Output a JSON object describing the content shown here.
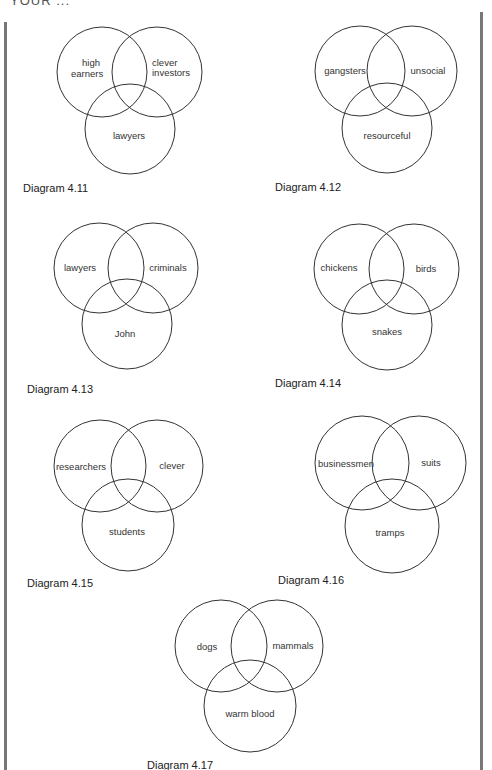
{
  "header": {
    "partial_text": "YOUR ..."
  },
  "diagrams": [
    {
      "caption": "Diagram 4.11",
      "sets": [
        "high earners",
        "clever investors",
        "lawyers"
      ],
      "marks": [
        "intersection clever investors ∩ lawyers (outside high earners)",
        "lawyers only"
      ]
    },
    {
      "caption": "Diagram 4.12",
      "sets": [
        "gangsters",
        "unsocial",
        "resourceful"
      ],
      "marks": [
        "gangsters only",
        "gangsters ∩ unsocial (outside resourceful)",
        "gangsters ∩ resourceful (outside unsocial)"
      ]
    },
    {
      "caption": "Diagram 4.13",
      "sets": [
        "lawyers",
        "criminals",
        "John"
      ],
      "marks": [
        "lawyers ∩ criminals (outside John)",
        "lawyers ∩ criminals ∩ John",
        "lawyers ∩ John (outside criminals)"
      ]
    },
    {
      "caption": "Diagram 4.14",
      "sets": [
        "chickens",
        "birds",
        "snakes"
      ],
      "marks": [
        "chickens only",
        "chickens ∩ snakes (outside birds)",
        "chickens ∩ birds ∩ snakes"
      ]
    },
    {
      "caption": "Diagram 4.15",
      "sets": [
        "researchers",
        "clever",
        "students"
      ],
      "marks": [
        "researchers only"
      ]
    },
    {
      "caption": "Diagram 4.16",
      "sets": [
        "businessmen",
        "suits",
        "tramps"
      ],
      "marks": [
        "businessmen only",
        "businessmen ∩ tramps (outside suits)",
        "businessmen ∩ suits ∩ tramps"
      ]
    },
    {
      "caption": "Diagram 4.17",
      "sets": [
        "dogs",
        "mammals",
        "warm blood"
      ],
      "marks": [
        "dogs only",
        "dogs ∩ mammals (outside warm blood)",
        "mammals only",
        "dogs ∩ warm blood (outside mammals)"
      ]
    }
  ],
  "labels": {
    "d411": {
      "a1": "high",
      "a2": "earners",
      "b1": "clever",
      "b2": "investors",
      "c": "lawyers"
    },
    "d412": {
      "a": "gangsters",
      "b": "unsocial",
      "c": "resourceful"
    },
    "d413": {
      "a": "lawyers",
      "b": "criminals",
      "c": "John"
    },
    "d414": {
      "a": "chickens",
      "b": "birds",
      "c": "snakes"
    },
    "d415": {
      "a": "researchers",
      "b": "clever",
      "c": "students"
    },
    "d416": {
      "a": "businessmen",
      "b": "suits",
      "c": "tramps"
    },
    "d417": {
      "a": "dogs",
      "b": "mammals",
      "c": "warm blood"
    }
  },
  "captions": {
    "d411": "Diagram 4.11",
    "d412": "Diagram 4.12",
    "d413": "Diagram 4.13",
    "d414": "Diagram 4.14",
    "d415": "Diagram 4.15",
    "d416": "Diagram 4.16",
    "d417": "Diagram 4.17"
  },
  "colors": {
    "stroke": "#333333",
    "margin_bar": "#777777",
    "background": "#ffffff"
  }
}
